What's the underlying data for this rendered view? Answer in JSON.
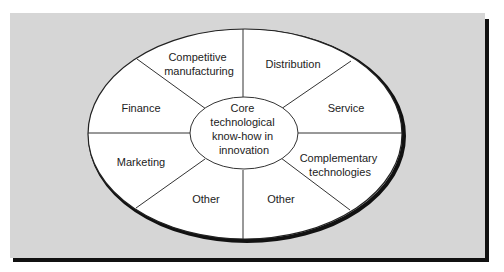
{
  "diagram": {
    "center": {
      "lines": [
        "Core",
        "technological",
        "know-how in",
        "innovation"
      ]
    },
    "segments": [
      {
        "id": "competitive-manufacturing",
        "lines": [
          "Competitive",
          "manufacturing"
        ]
      },
      {
        "id": "distribution",
        "lines": [
          "Distribution"
        ]
      },
      {
        "id": "service",
        "lines": [
          "Service"
        ]
      },
      {
        "id": "complementary-technologies",
        "lines": [
          "Complementary",
          "technologies"
        ]
      },
      {
        "id": "other-right",
        "lines": [
          "Other"
        ]
      },
      {
        "id": "other-left",
        "lines": [
          "Other"
        ]
      },
      {
        "id": "marketing",
        "lines": [
          "Marketing"
        ]
      },
      {
        "id": "finance",
        "lines": [
          "Finance"
        ]
      }
    ],
    "colors": {
      "background": "#d6d6d6",
      "ellipse_fill": "#ffffff",
      "stroke": "#222222",
      "shadow": "#111111"
    }
  }
}
